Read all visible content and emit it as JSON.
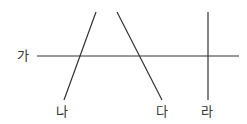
{
  "diagram": {
    "labels": {
      "ga": "가",
      "na": "나",
      "da": "다",
      "ra": "라"
    },
    "line_color": "#333333",
    "lines": [
      {
        "name": "가",
        "x1": 37,
        "y1": 56,
        "x2": 239,
        "y2": 56
      },
      {
        "name": "나",
        "x1": 96,
        "y1": 12,
        "x2": 64,
        "y2": 100
      },
      {
        "name": "다",
        "x1": 117,
        "y1": 12,
        "x2": 162,
        "y2": 100
      },
      {
        "name": "라",
        "x1": 208,
        "y1": 12,
        "x2": 208,
        "y2": 100
      }
    ]
  }
}
